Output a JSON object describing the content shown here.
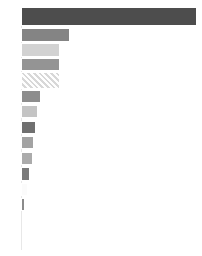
{
  "chart_data": {
    "type": "bar",
    "orientation": "horizontal",
    "title": "",
    "subtitle": "",
    "xlabel": "",
    "ylabel": "",
    "categories": [
      "1",
      "2",
      "3",
      "4",
      "5",
      "6",
      "7",
      "8",
      "9",
      "10",
      "11",
      "12",
      "13"
    ],
    "values": [
      100.0,
      27.9,
      22.2,
      22.2,
      22.2,
      11.4,
      9.7,
      8.5,
      7.4,
      6.8,
      5.1,
      4.0,
      2.3
    ],
    "xlim": [
      0,
      100
    ],
    "ylim": [
      0,
      13
    ],
    "grid": false,
    "legend": false,
    "legend_position": "none",
    "tick_labels_x": [],
    "tick_labels_y": [],
    "annotations": [],
    "bar_styles": [
      {
        "category": "1",
        "value": 100.0,
        "color": "#4d4d4d",
        "fill": "solid"
      },
      {
        "category": "2",
        "value": 27.9,
        "color": "#848484",
        "fill": "solid"
      },
      {
        "category": "3",
        "value": 22.2,
        "color": "#d2d2d2",
        "fill": "solid"
      },
      {
        "category": "4",
        "value": 22.2,
        "color": "#949494",
        "fill": "solid"
      },
      {
        "category": "5",
        "value": 22.2,
        "color": "#f0f0f0",
        "fill": "hatched"
      },
      {
        "category": "6",
        "value": 11.4,
        "color": "#8d8d8d",
        "fill": "solid"
      },
      {
        "category": "7",
        "value": 9.7,
        "color": "#c4c4c4",
        "fill": "solid"
      },
      {
        "category": "8",
        "value": 8.5,
        "color": "#707070",
        "fill": "solid"
      },
      {
        "category": "9",
        "value": 7.4,
        "color": "#a3a3a3",
        "fill": "solid"
      },
      {
        "category": "10",
        "value": 6.8,
        "color": "#ababab",
        "fill": "solid"
      },
      {
        "category": "11",
        "value": 5.1,
        "color": "#7a7a7a",
        "fill": "solid"
      },
      {
        "category": "12",
        "value": 4.0,
        "color": "#fbfbfb",
        "fill": "solid"
      },
      {
        "category": "13",
        "value": 2.3,
        "color": "#8b8b8b",
        "fill": "solid"
      }
    ],
    "colors": {
      "background": "#ffffff",
      "axis": "#e8e8e8",
      "bar_edge": "#ffffff",
      "darkest_bar": "#4d4d4d",
      "lightest_bar": "#fbfbfb"
    }
  }
}
